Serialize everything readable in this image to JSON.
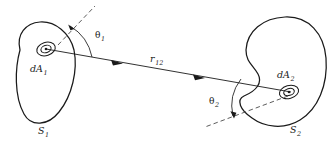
{
  "figure": {
    "type": "geometry-diagram",
    "background_color": "#ffffff",
    "line_color": "#1a1a1a",
    "dash_color": "#4a4a4a"
  },
  "labels": {
    "surface1": {
      "base": "S",
      "sub": "1"
    },
    "surface2": {
      "base": "S",
      "sub": "2"
    },
    "element1": {
      "base": "dA",
      "sub": "1"
    },
    "element2": {
      "base": "dA",
      "sub": "2"
    },
    "distance": {
      "base": "r",
      "sub": "12"
    },
    "angle1": {
      "base": "θ",
      "sub": "1"
    },
    "angle2": {
      "base": "θ",
      "sub": "2"
    }
  },
  "geometry": {
    "surface1_outline": "M 18 52 C 14 33 27 22 42 23 C 58 24 72 36 74 52 C 77 72 70 98 56 115 C 46 127 30 126 23 114 C 13 97 14 72 18 52 Z",
    "surface2_outline": "M 243 60 C 245 36 262 19 284 18 C 307 17 322 33 325 56 C 328 82 320 108 302 119 C 285 129 263 127 250 117 C 239 108 236 97 243 95 C 254 92 262 86 258 76 C 255 68 247 68 243 60 Z",
    "ray_start": {
      "x": 47,
      "y": 49
    },
    "ray_end": {
      "x": 290,
      "y": 92
    },
    "ray_arrow1": {
      "x": 117,
      "y": 62
    },
    "ray_arrow2": {
      "x": 199,
      "y": 77
    },
    "normal1": {
      "x1": 60,
      "y1": 43,
      "x2": 92,
      "y2": 8
    },
    "normal2": {
      "x1": 285,
      "y1": 97,
      "x2": 207,
      "y2": 125
    },
    "arc1_sweep_deg": 42,
    "arc2_sweep_deg": 39,
    "patch1_center": {
      "x": 46,
      "y": 49
    },
    "patch2_center": {
      "x": 289,
      "y": 92
    }
  }
}
